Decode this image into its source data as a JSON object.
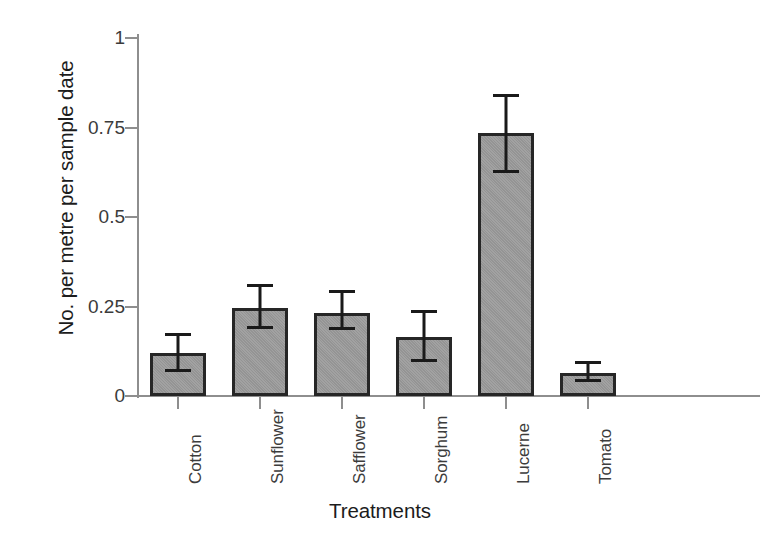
{
  "chart_data": {
    "type": "bar",
    "title": "",
    "xlabel": "Treatments",
    "ylabel": "No. per metre per sample date",
    "ylim": [
      0,
      1
    ],
    "yticks": [
      "0",
      "0.25",
      "0.5",
      "0.75",
      "1"
    ],
    "ytick_values": [
      0,
      0.25,
      0.5,
      0.75,
      1
    ],
    "grid": false,
    "legend": null,
    "categories": [
      "Cotton",
      "Sunflower",
      "Safflower",
      "Sorghum",
      "Lucerne",
      "Tomato"
    ],
    "values": [
      0.12,
      0.245,
      0.232,
      0.165,
      0.735,
      0.065
    ],
    "errors_upper": [
      0.175,
      0.313,
      0.297,
      0.24,
      0.843,
      0.097
    ],
    "errors_lower": [
      0.067,
      0.188,
      0.183,
      0.095,
      0.623,
      0.04
    ],
    "error_plus": [
      0.055,
      0.068,
      0.065,
      0.075,
      0.108,
      0.032
    ],
    "error_minus": [
      0.053,
      0.057,
      0.049,
      0.07,
      0.112,
      0.025
    ],
    "bar_fill_color": "#9c9c9c",
    "bar_edge_color": "#262626",
    "error_bar_color": "#1a1a1a",
    "axis_color": "#8e8e8e",
    "background_color": "#ffffff"
  }
}
